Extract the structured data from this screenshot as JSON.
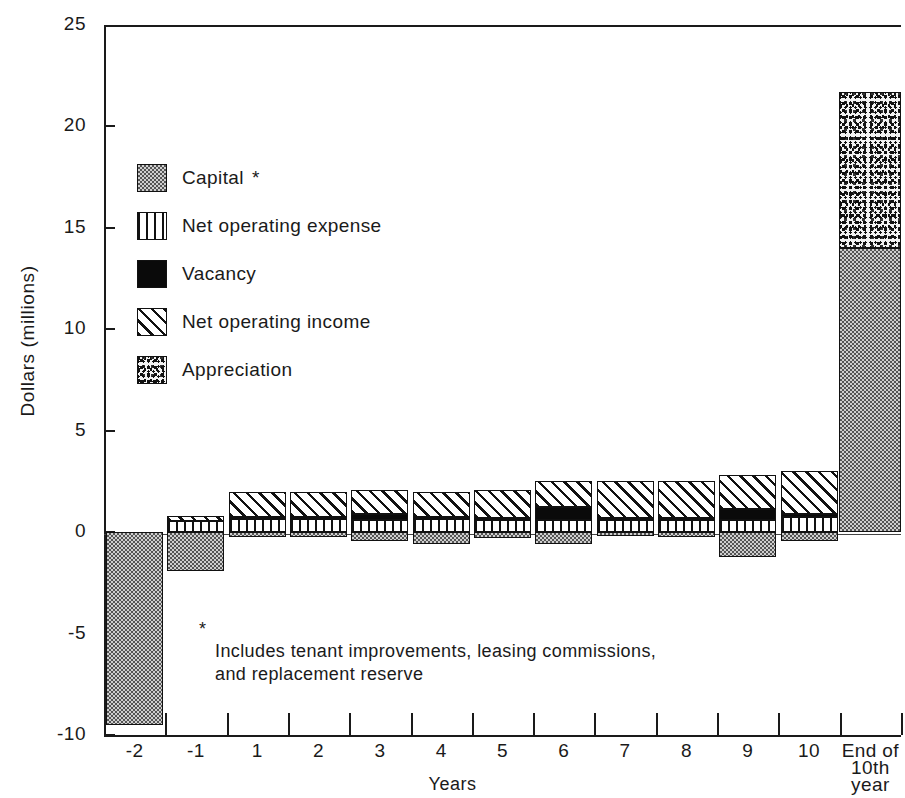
{
  "chart_data": {
    "type": "bar",
    "subtype": "stacked-bar-with-negatives",
    "title": "",
    "xlabel": "Years",
    "ylabel": "Dollars (millions)",
    "ylim": [
      -10,
      25
    ],
    "yticks": [
      25,
      20,
      15,
      10,
      5,
      0,
      -5,
      -10
    ],
    "ytick_labels": [
      "25",
      "20",
      "15",
      "10",
      "5",
      "0",
      "-5",
      "-10"
    ],
    "grid": false,
    "legend_position": "upper-left-inside",
    "categories": [
      "-2",
      "-1",
      "1",
      "2",
      "3",
      "4",
      "5",
      "6",
      "7",
      "8",
      "9",
      "10",
      "End of 10th year"
    ],
    "category_labels": [
      {
        "line1": "-2",
        "line2": "",
        "line3": ""
      },
      {
        "line1": "-1",
        "line2": "",
        "line3": ""
      },
      {
        "line1": "1",
        "line2": "",
        "line3": ""
      },
      {
        "line1": "2",
        "line2": "",
        "line3": ""
      },
      {
        "line1": "3",
        "line2": "",
        "line3": ""
      },
      {
        "line1": "4",
        "line2": "",
        "line3": ""
      },
      {
        "line1": "5",
        "line2": "",
        "line3": ""
      },
      {
        "line1": "6",
        "line2": "",
        "line3": ""
      },
      {
        "line1": "7",
        "line2": "",
        "line3": ""
      },
      {
        "line1": "8",
        "line2": "",
        "line3": ""
      },
      {
        "line1": "9",
        "line2": "",
        "line3": ""
      },
      {
        "line1": "10",
        "line2": "",
        "line3": ""
      },
      {
        "line1": "End of",
        "line2": "10th",
        "line3": "year"
      }
    ],
    "series": [
      {
        "name": "Capital",
        "key": "capital",
        "values": [
          -9.5,
          -1.9,
          -0.25,
          -0.25,
          -0.45,
          -0.6,
          -0.3,
          -0.6,
          -0.2,
          -0.25,
          -1.25,
          -0.45,
          14.0
        ]
      },
      {
        "name": "Net operating expense",
        "key": "expense",
        "values": [
          0,
          0.55,
          0.65,
          0.65,
          0.6,
          0.65,
          0.6,
          0.6,
          0.6,
          0.6,
          0.6,
          0.75,
          0
        ]
      },
      {
        "name": "Vacancy",
        "key": "vacancy",
        "values": [
          0,
          0,
          0.12,
          0.12,
          0.28,
          0.1,
          0.12,
          0.65,
          0.1,
          0.1,
          0.55,
          0.12,
          0
        ]
      },
      {
        "name": "Net operating income",
        "key": "noi",
        "values": [
          0,
          0.25,
          1.23,
          1.23,
          1.22,
          1.25,
          1.38,
          1.25,
          1.8,
          1.8,
          1.65,
          2.13,
          0
        ]
      },
      {
        "name": "Appreciation",
        "key": "appreciation",
        "values": [
          0,
          0,
          0,
          0,
          0,
          0,
          0,
          0,
          0,
          0,
          0,
          0,
          7.7
        ]
      }
    ],
    "legend": [
      {
        "label": "Capital",
        "pattern": "stipple-grey",
        "footnote_marker": "*"
      },
      {
        "label": "Net operating expense",
        "pattern": "vertical-lines",
        "footnote_marker": ""
      },
      {
        "label": "Vacancy",
        "pattern": "solid-black",
        "footnote_marker": ""
      },
      {
        "label": "Net operating income",
        "pattern": "diagonal-hatch",
        "footnote_marker": ""
      },
      {
        "label": "Appreciation",
        "pattern": "speckle",
        "footnote_marker": ""
      }
    ],
    "annotations": [
      {
        "marker": "*",
        "text": "Includes tenant improvements, leasing commissions,\nand replacement reserve"
      }
    ],
    "colors": {
      "ink": "#1a1a1a",
      "background": "#ffffff",
      "capital_fill": "#cfcfcf",
      "vacancy_fill": "#0a0a0a",
      "appreciation_fill": "#f2f2f2"
    }
  },
  "bottom_caption": ""
}
